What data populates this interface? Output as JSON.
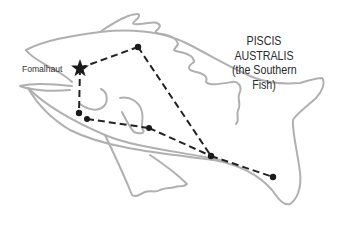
{
  "diagram": {
    "title_lines": [
      "PISCIS",
      "AUSTRALIS",
      "(the Southern",
      "Fish)"
    ],
    "bright_star_label": "Fomalhaut",
    "colors": {
      "outline": "#b0b0b0",
      "constellation_lines": "#222222",
      "stars": "#1a1a1a",
      "text": "#2a2a2a",
      "background": "#ffffff"
    },
    "stars": [
      {
        "id": "fomalhaut",
        "x": 80,
        "y": 68,
        "shape": "star"
      },
      {
        "id": "s2",
        "x": 138,
        "y": 47,
        "shape": "dot"
      },
      {
        "id": "s3",
        "x": 79,
        "y": 113,
        "shape": "dot"
      },
      {
        "id": "s4",
        "x": 87,
        "y": 119,
        "shape": "dot"
      },
      {
        "id": "s5",
        "x": 149,
        "y": 128,
        "shape": "dot"
      },
      {
        "id": "s6",
        "x": 211,
        "y": 156,
        "shape": "dot"
      },
      {
        "id": "s7",
        "x": 273,
        "y": 177,
        "shape": "dot"
      }
    ],
    "connections": [
      [
        "fomalhaut",
        "s2"
      ],
      [
        "s2",
        "s6"
      ],
      [
        "fomalhaut",
        "s3"
      ],
      [
        "s4",
        "s5"
      ],
      [
        "s5",
        "s6"
      ],
      [
        "s6",
        "s7"
      ]
    ]
  }
}
